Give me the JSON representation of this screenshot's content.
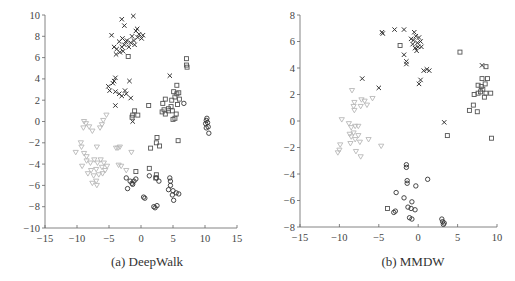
{
  "chart_data": [
    {
      "type": "scatter",
      "title": "(a) DeepWalk",
      "caption": "(a) DeepWalk",
      "xlabel": "",
      "ylabel": "",
      "xlim": [
        -15,
        15
      ],
      "ylim": [
        -10,
        10
      ],
      "xticks": [
        -15,
        -10,
        -5,
        0,
        5,
        10,
        15
      ],
      "yticks": [
        -10,
        -8,
        -6,
        -4,
        -2,
        0,
        2,
        4,
        6,
        8,
        10
      ],
      "grid": false,
      "legend": "none",
      "series": [
        {
          "name": "class-x",
          "marker": "x",
          "color": "#333333",
          "points": [
            [
              -3.0,
              9.6
            ],
            [
              -1.2,
              9.9
            ],
            [
              -2.6,
              9.0
            ],
            [
              -4.6,
              8.1
            ],
            [
              -0.8,
              8.5
            ],
            [
              -0.3,
              8.2
            ],
            [
              0.3,
              8.1
            ],
            [
              -0.5,
              7.9
            ],
            [
              -1.1,
              7.6
            ],
            [
              -1.6,
              7.4
            ],
            [
              -2.2,
              7.6
            ],
            [
              -2.9,
              7.8
            ],
            [
              -3.4,
              7.5
            ],
            [
              -2.6,
              7.2
            ],
            [
              -1.9,
              7.0
            ],
            [
              -3.8,
              6.8
            ],
            [
              -3.3,
              6.5
            ],
            [
              -3.9,
              6.3
            ],
            [
              -2.8,
              6.6
            ],
            [
              -1.0,
              7.2
            ],
            [
              0.1,
              7.8
            ],
            [
              -0.6,
              8.7
            ],
            [
              -1.4,
              8.0
            ],
            [
              -2.4,
              7.5
            ],
            [
              -3.0,
              7.0
            ],
            [
              -4.2,
              7.0
            ],
            [
              -5.1,
              3.3
            ],
            [
              -4.9,
              2.9
            ],
            [
              -4.2,
              3.8
            ],
            [
              -4.0,
              4.1
            ],
            [
              -4.4,
              3.6
            ],
            [
              -1.8,
              3.8
            ],
            [
              -4.0,
              2.8
            ],
            [
              -3.4,
              2.6
            ],
            [
              -3.0,
              2.4
            ],
            [
              -2.5,
              2.9
            ],
            [
              -1.6,
              2.2
            ],
            [
              -4.0,
              1.5
            ],
            [
              -2.3,
              2.6
            ],
            [
              4.5,
              4.3
            ],
            [
              -1.3,
              0.0
            ]
          ]
        },
        {
          "name": "class-square",
          "marker": "square",
          "color": "#555555",
          "points": [
            [
              -2.0,
              6.1
            ],
            [
              7.1,
              5.9
            ],
            [
              7.1,
              5.3
            ],
            [
              7.2,
              5.1
            ],
            [
              5.6,
              3.4
            ],
            [
              3.8,
              2.1
            ],
            [
              3.4,
              1.7
            ],
            [
              5.1,
              2.8
            ],
            [
              5.6,
              2.6
            ],
            [
              5.9,
              2.7
            ],
            [
              6.0,
              2.1
            ],
            [
              5.3,
              2.3
            ],
            [
              4.8,
              2.0
            ],
            [
              5.7,
              1.6
            ],
            [
              4.7,
              1.4
            ],
            [
              4.3,
              1.2
            ],
            [
              3.6,
              1.1
            ],
            [
              3.3,
              0.9
            ],
            [
              4.9,
              1.0
            ],
            [
              5.5,
              0.7
            ],
            [
              5.3,
              0.3
            ],
            [
              5.0,
              0.2
            ],
            [
              4.3,
              1.0
            ],
            [
              3.8,
              0.7
            ],
            [
              -1.0,
              1.0
            ],
            [
              -1.3,
              0.6
            ],
            [
              -1.4,
              0.4
            ],
            [
              1.2,
              1.5
            ],
            [
              2.5,
              -1.5
            ],
            [
              5.8,
              -1.8
            ],
            [
              2.4,
              -2.0
            ],
            [
              2.9,
              -2.3
            ],
            [
              1.5,
              -2.5
            ],
            [
              -0.8,
              -4.7
            ],
            [
              1.3,
              -4.4
            ],
            [
              2.4,
              -5.0
            ],
            [
              2.3,
              -5.3
            ],
            [
              -0.5,
              0.6
            ]
          ]
        },
        {
          "name": "class-circle",
          "marker": "circle",
          "color": "#333333",
          "points": [
            [
              10.3,
              0.3
            ],
            [
              10.2,
              0.1
            ],
            [
              10.4,
              -0.1
            ],
            [
              10.1,
              -0.2
            ],
            [
              10.5,
              -0.5
            ],
            [
              10.2,
              -0.6
            ],
            [
              10.6,
              -1.1
            ],
            [
              6.7,
              1.7
            ],
            [
              -2.3,
              -5.3
            ],
            [
              -1.7,
              -5.6
            ],
            [
              -1.4,
              -5.8
            ],
            [
              -1.1,
              -5.6
            ],
            [
              -0.8,
              -5.4
            ],
            [
              -2.1,
              -6.3
            ],
            [
              -1.3,
              -5.9
            ],
            [
              1.3,
              -5.1
            ],
            [
              2.4,
              -5.3
            ],
            [
              2.8,
              -5.6
            ],
            [
              4.5,
              -5.3
            ],
            [
              4.6,
              -5.6
            ],
            [
              4.6,
              -6.0
            ],
            [
              4.3,
              -6.4
            ],
            [
              5.0,
              -6.5
            ],
            [
              5.5,
              -6.7
            ],
            [
              5.9,
              -6.8
            ],
            [
              4.9,
              -6.9
            ],
            [
              5.1,
              -7.4
            ],
            [
              0.4,
              -7.1
            ],
            [
              0.6,
              -7.2
            ],
            [
              2.0,
              -8.0
            ],
            [
              2.2,
              -8.1
            ],
            [
              2.5,
              -7.9
            ]
          ]
        },
        {
          "name": "class-triangle",
          "marker": "triangle-down",
          "color": "#b8b8b8",
          "points": [
            [
              -8.9,
              0.0
            ],
            [
              -8.6,
              -0.2
            ],
            [
              -9.0,
              -0.6
            ],
            [
              -8.1,
              -0.5
            ],
            [
              -7.6,
              -0.9
            ],
            [
              -6.4,
              -0.6
            ],
            [
              -6.1,
              -0.3
            ],
            [
              -5.9,
              0.1
            ],
            [
              -5.4,
              0.6
            ],
            [
              -9.4,
              -2.0
            ],
            [
              -10.2,
              -2.9
            ],
            [
              -9.3,
              -2.4
            ],
            [
              -8.9,
              -3.0
            ],
            [
              -8.5,
              -3.3
            ],
            [
              -6.9,
              -2.4
            ],
            [
              -8.5,
              -3.7
            ],
            [
              -7.9,
              -3.9
            ],
            [
              -7.3,
              -3.6
            ],
            [
              -6.8,
              -3.9
            ],
            [
              -6.3,
              -3.6
            ],
            [
              -5.8,
              -3.9
            ],
            [
              -5.3,
              -4.2
            ],
            [
              -6.1,
              -4.3
            ],
            [
              -7.0,
              -4.5
            ],
            [
              -7.8,
              -4.6
            ],
            [
              -8.3,
              -4.9
            ],
            [
              -7.4,
              -5.1
            ],
            [
              -6.6,
              -5.0
            ],
            [
              -6.0,
              -4.9
            ],
            [
              -5.6,
              -4.6
            ],
            [
              -7.0,
              -5.6
            ],
            [
              -7.6,
              -5.8
            ],
            [
              -6.9,
              -6.0
            ],
            [
              -3.6,
              -2.5
            ],
            [
              -3.3,
              -2.4
            ],
            [
              -3.9,
              -2.5
            ],
            [
              -1.5,
              -2.9
            ],
            [
              -3.5,
              -4.1
            ],
            [
              -3.1,
              -4.2
            ],
            [
              -2.3,
              -4.6
            ],
            [
              -9.2,
              -4.2
            ]
          ]
        }
      ]
    },
    {
      "type": "scatter",
      "title": "(b) MMDW",
      "caption": "(b) MMDW",
      "xlabel": "",
      "ylabel": "",
      "xlim": [
        -15,
        10
      ],
      "ylim": [
        -8,
        8
      ],
      "xticks": [
        -15,
        -10,
        -5,
        0,
        5,
        10
      ],
      "yticks": [
        -8,
        -6,
        -4,
        -2,
        0,
        2,
        4,
        6,
        8
      ],
      "grid": false,
      "legend": "none",
      "series": [
        {
          "name": "class-x",
          "marker": "x",
          "color": "#333333",
          "points": [
            [
              -4.6,
              6.7
            ],
            [
              -4.5,
              6.6
            ],
            [
              -3.0,
              6.9
            ],
            [
              -1.8,
              6.9
            ],
            [
              -0.5,
              6.7
            ],
            [
              -0.3,
              6.4
            ],
            [
              0.1,
              6.3
            ],
            [
              -0.6,
              6.1
            ],
            [
              -0.1,
              5.9
            ],
            [
              0.3,
              6.0
            ],
            [
              -0.7,
              5.8
            ],
            [
              -0.4,
              5.5
            ],
            [
              0.0,
              5.6
            ],
            [
              -0.9,
              6.2
            ],
            [
              -0.2,
              5.3
            ],
            [
              0.4,
              5.6
            ],
            [
              -1.8,
              5.0
            ],
            [
              -1.5,
              4.5
            ],
            [
              -1.5,
              4.3
            ],
            [
              0.7,
              3.8
            ],
            [
              1.1,
              3.9
            ],
            [
              1.4,
              3.8
            ],
            [
              0.3,
              3.1
            ],
            [
              0.1,
              2.8
            ],
            [
              -7.1,
              3.2
            ],
            [
              -5.0,
              2.5
            ],
            [
              3.3,
              -0.1
            ],
            [
              8.1,
              4.2
            ]
          ]
        },
        {
          "name": "class-square",
          "marker": "square",
          "color": "#555555",
          "points": [
            [
              -2.3,
              5.7
            ],
            [
              5.3,
              5.2
            ],
            [
              8.6,
              4.1
            ],
            [
              8.1,
              3.2
            ],
            [
              8.8,
              3.2
            ],
            [
              7.6,
              2.7
            ],
            [
              8.0,
              2.6
            ],
            [
              8.5,
              2.8
            ],
            [
              8.2,
              2.4
            ],
            [
              7.9,
              2.2
            ],
            [
              8.6,
              2.1
            ],
            [
              9.2,
              2.1
            ],
            [
              7.6,
              2.1
            ],
            [
              8.4,
              1.8
            ],
            [
              7.1,
              2.0
            ],
            [
              7.0,
              1.2
            ],
            [
              6.5,
              0.8
            ],
            [
              7.5,
              0.7
            ],
            [
              3.7,
              -1.1
            ],
            [
              9.3,
              -1.3
            ],
            [
              -3.9,
              -6.6
            ]
          ]
        },
        {
          "name": "class-circle",
          "marker": "circle",
          "color": "#333333",
          "points": [
            [
              -1.5,
              -3.3
            ],
            [
              -1.5,
              -3.5
            ],
            [
              -1.4,
              -4.5
            ],
            [
              -1.4,
              -4.7
            ],
            [
              1.2,
              -4.4
            ],
            [
              -0.3,
              -4.9
            ],
            [
              -2.8,
              -5.4
            ],
            [
              -1.8,
              -5.8
            ],
            [
              -0.8,
              -6.1
            ],
            [
              -1.3,
              -6.5
            ],
            [
              -0.9,
              -6.6
            ],
            [
              -0.4,
              -6.7
            ],
            [
              -2.9,
              -6.8
            ],
            [
              -3.1,
              -6.9
            ],
            [
              -1.1,
              -7.3
            ],
            [
              -0.8,
              -7.4
            ],
            [
              3.0,
              -7.4
            ],
            [
              3.1,
              -7.6
            ],
            [
              3.2,
              -7.8
            ],
            [
              3.3,
              -7.7
            ]
          ]
        },
        {
          "name": "class-triangle",
          "marker": "triangle-down",
          "color": "#b8b8b8",
          "points": [
            [
              -8.4,
              2.3
            ],
            [
              -8.1,
              1.4
            ],
            [
              -8.2,
              1.1
            ],
            [
              -7.2,
              1.6
            ],
            [
              -6.8,
              1.5
            ],
            [
              -7.3,
              1.1
            ],
            [
              -6.5,
              1.2
            ],
            [
              -5.8,
              1.7
            ],
            [
              -8.1,
              0.8
            ],
            [
              -9.7,
              0.1
            ],
            [
              -8.8,
              -0.2
            ],
            [
              -8.5,
              -0.5
            ],
            [
              -8.0,
              -0.4
            ],
            [
              -8.2,
              -0.9
            ],
            [
              -7.6,
              -0.4
            ],
            [
              -7.6,
              -1.1
            ],
            [
              -8.5,
              -1.2
            ],
            [
              -8.0,
              -1.4
            ],
            [
              -8.6,
              -1.7
            ],
            [
              -7.4,
              -1.6
            ],
            [
              -7.9,
              -2.3
            ],
            [
              -7.3,
              -2.7
            ],
            [
              -9.9,
              -1.8
            ],
            [
              -10.0,
              -2.2
            ],
            [
              -10.2,
              -2.4
            ],
            [
              -6.3,
              -1.4
            ],
            [
              -4.7,
              -1.9
            ],
            [
              -8.7,
              -1.0
            ]
          ]
        }
      ]
    }
  ]
}
